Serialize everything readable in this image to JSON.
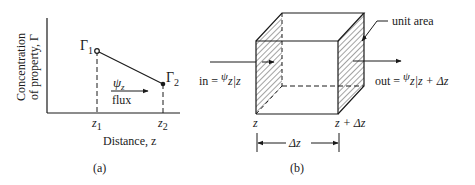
{
  "panel_a": {
    "caption": "(a)",
    "ylabel_line1": "Concentration",
    "ylabel_line2": "of property, Γ",
    "xlabel": "Distance, z",
    "points": [
      {
        "label": "Γ",
        "sub": "1",
        "x_label": "z",
        "x_sub": "1"
      },
      {
        "label": "Γ",
        "sub": "2",
        "x_label": "z",
        "x_sub": "2"
      }
    ],
    "flux_symbol": "ψ",
    "flux_sub": "z",
    "flux_label": "flux"
  },
  "panel_b": {
    "caption": "(b)",
    "unit_area_label": "unit area",
    "in_label": "in = ",
    "in_psi": "ψ",
    "in_sub": "z",
    "in_eval": "|z",
    "out_label": "out = ",
    "out_psi": "ψ",
    "out_sub": "z",
    "out_eval": "|z + Δz",
    "left_face_label": "z",
    "right_face_label": "z + Δz",
    "width_label": "Δz"
  },
  "colors": {
    "ink": "#1a1a1a",
    "background": "#ffffff"
  }
}
